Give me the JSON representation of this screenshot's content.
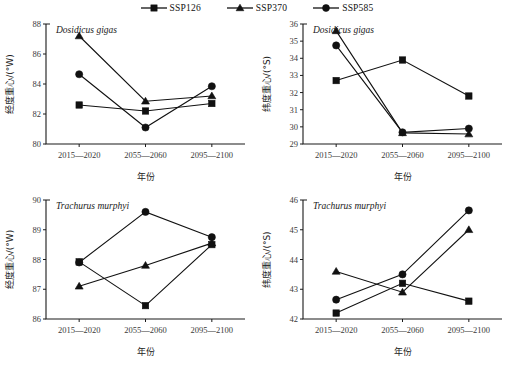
{
  "legend": {
    "items": [
      {
        "label": "SSP126",
        "marker": "square",
        "icon": "square-marker-icon"
      },
      {
        "label": "SSP370",
        "marker": "triangle",
        "icon": "triangle-marker-icon"
      },
      {
        "label": "SSP585",
        "marker": "circle",
        "icon": "circle-marker-icon"
      }
    ]
  },
  "common": {
    "xlabel": "年份",
    "categories": [
      "2015—2020",
      "2055—2060",
      "2095—2100"
    ]
  },
  "chart_data": [
    {
      "id": "dosidicus-longitude",
      "type": "line",
      "title": "Dosidicus gigas",
      "xlabel": "年份",
      "ylabel": "经度重心/(°W)",
      "categories": [
        "2015—2020",
        "2055—2060",
        "2095—2100"
      ],
      "ylim": [
        80,
        88
      ],
      "yticks": [
        80,
        82,
        84,
        86,
        88
      ],
      "grid": false,
      "legend_position": "top-center",
      "series": [
        {
          "name": "SSP126",
          "marker": "square",
          "values": [
            82.6,
            82.2,
            82.7
          ]
        },
        {
          "name": "SSP370",
          "marker": "triangle",
          "values": [
            87.2,
            82.85,
            83.2
          ]
        },
        {
          "name": "SSP585",
          "marker": "circle",
          "values": [
            84.65,
            81.1,
            83.85
          ]
        }
      ]
    },
    {
      "id": "dosidicus-latitude",
      "type": "line",
      "title": "Dosidicus gigas",
      "xlabel": "年份",
      "ylabel": "纬度重心/(°S)",
      "categories": [
        "2015—2020",
        "2055—2060",
        "2095—2100"
      ],
      "ylim": [
        29,
        36
      ],
      "yticks": [
        29,
        30,
        31,
        32,
        33,
        34,
        35,
        36
      ],
      "grid": false,
      "legend_position": "top-center",
      "series": [
        {
          "name": "SSP126",
          "marker": "square",
          "values": [
            32.7,
            33.9,
            31.8
          ]
        },
        {
          "name": "SSP370",
          "marker": "triangle",
          "values": [
            35.6,
            29.65,
            29.58
          ]
        },
        {
          "name": "SSP585",
          "marker": "circle",
          "values": [
            34.75,
            29.68,
            29.9
          ]
        }
      ]
    },
    {
      "id": "trachurus-longitude",
      "type": "line",
      "title": "Trachurus murphyi",
      "xlabel": "年份",
      "ylabel": "经度重心/(°W)",
      "categories": [
        "2015—2020",
        "2055—2060",
        "2095—2100"
      ],
      "ylim": [
        86,
        90
      ],
      "yticks": [
        86,
        87,
        88,
        89,
        90
      ],
      "grid": false,
      "legend_position": "top-center",
      "series": [
        {
          "name": "SSP126",
          "marker": "square",
          "values": [
            87.92,
            86.45,
            88.5
          ]
        },
        {
          "name": "SSP370",
          "marker": "triangle",
          "values": [
            87.1,
            87.8,
            88.55
          ]
        },
        {
          "name": "SSP585",
          "marker": "circle",
          "values": [
            87.9,
            89.6,
            88.75
          ]
        }
      ]
    },
    {
      "id": "trachurus-latitude",
      "type": "line",
      "title": "Trachurus murphyi",
      "xlabel": "年份",
      "ylabel": "纬度重心/(°S)",
      "categories": [
        "2015—2020",
        "2055—2060",
        "2095—2100"
      ],
      "ylim": [
        42,
        46
      ],
      "yticks": [
        42,
        43,
        44,
        45,
        46
      ],
      "grid": false,
      "legend_position": "top-center",
      "series": [
        {
          "name": "SSP126",
          "marker": "square",
          "values": [
            42.2,
            43.2,
            42.6
          ]
        },
        {
          "name": "SSP370",
          "marker": "triangle",
          "values": [
            43.6,
            42.9,
            45.0
          ]
        },
        {
          "name": "SSP585",
          "marker": "circle",
          "values": [
            42.65,
            43.5,
            45.65
          ]
        }
      ]
    }
  ],
  "colors": {
    "ink": "#111111",
    "axis": "#1a1a1a",
    "tick_text": "#3a3a3a"
  }
}
